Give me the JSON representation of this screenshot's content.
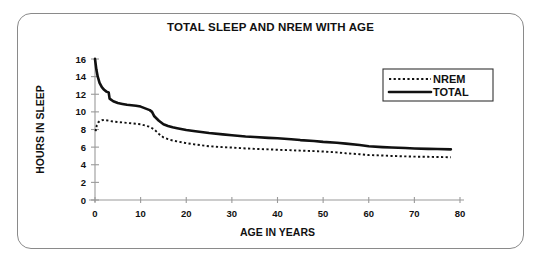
{
  "figure": {
    "title": "TOTAL SLEEP AND NREM WITH AGE",
    "frame_color": "#8a8a8a",
    "background": "#ffffff"
  },
  "chart_data": {
    "type": "line",
    "title": "TOTAL SLEEP AND NREM WITH AGE",
    "xlabel": "AGE IN YEARS",
    "ylabel": "HOURS IN SLEEP",
    "xlim": [
      0,
      80
    ],
    "ylim": [
      0,
      16
    ],
    "xticks": [
      0,
      10,
      20,
      30,
      40,
      50,
      60,
      70,
      80
    ],
    "yticks": [
      0,
      2,
      4,
      6,
      8,
      10,
      12,
      14,
      16
    ],
    "grid": false,
    "legend_position": "top-right",
    "legend": [
      "NREM",
      "TOTAL"
    ],
    "series": [
      {
        "name": "TOTAL",
        "style": "solid",
        "color": "#111111",
        "x": [
          0,
          0.3,
          0.6,
          1,
          1.5,
          2,
          2.5,
          3,
          3.2,
          4,
          5,
          6,
          7,
          8,
          9,
          10,
          11,
          12,
          12.5,
          13,
          14,
          15,
          16,
          17,
          18,
          20,
          22,
          25,
          28,
          30,
          33,
          35,
          38,
          40,
          43,
          45,
          48,
          50,
          53,
          55,
          58,
          60,
          63,
          65,
          68,
          70,
          73,
          75,
          78
        ],
        "y": [
          16.0,
          14.8,
          14.0,
          13.3,
          12.8,
          12.5,
          12.3,
          12.2,
          11.5,
          11.2,
          11.0,
          10.9,
          10.8,
          10.75,
          10.7,
          10.6,
          10.4,
          10.2,
          10.0,
          9.5,
          9.0,
          8.6,
          8.4,
          8.25,
          8.15,
          7.95,
          7.8,
          7.6,
          7.45,
          7.35,
          7.2,
          7.15,
          7.05,
          7.0,
          6.9,
          6.8,
          6.7,
          6.6,
          6.5,
          6.4,
          6.25,
          6.1,
          6.0,
          5.95,
          5.9,
          5.85,
          5.8,
          5.78,
          5.75
        ]
      },
      {
        "name": "NREM",
        "style": "dotted",
        "color": "#111111",
        "x": [
          0,
          0.2,
          0.4,
          0.7,
          1,
          1.5,
          2,
          2.5,
          3,
          4,
          5,
          6,
          7,
          8,
          9,
          10,
          11,
          12,
          13,
          14,
          15,
          16,
          17,
          18,
          20,
          22,
          25,
          28,
          30,
          33,
          35,
          38,
          40,
          43,
          45,
          48,
          50,
          53,
          55,
          58,
          60,
          63,
          65,
          68,
          70,
          73,
          75,
          78
        ],
        "y": [
          8.0,
          7.9,
          8.5,
          8.8,
          8.95,
          9.05,
          9.1,
          9.05,
          9.0,
          8.9,
          8.85,
          8.8,
          8.75,
          8.7,
          8.65,
          8.6,
          8.45,
          8.3,
          8.0,
          7.5,
          7.1,
          6.9,
          6.75,
          6.65,
          6.45,
          6.3,
          6.1,
          6.0,
          5.95,
          5.85,
          5.8,
          5.75,
          5.7,
          5.65,
          5.6,
          5.55,
          5.5,
          5.4,
          5.3,
          5.2,
          5.1,
          5.05,
          5.0,
          4.95,
          4.92,
          4.9,
          4.88,
          4.85
        ]
      }
    ]
  }
}
